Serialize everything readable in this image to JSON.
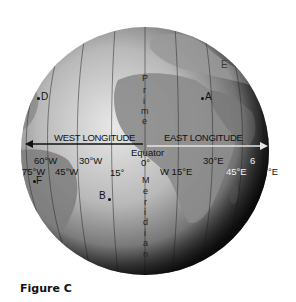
{
  "figure": {
    "caption": "Figure C",
    "globe": {
      "center": [
        145,
        151
      ],
      "radius": 124
    },
    "prime_meridian_label": [
      "P",
      "r",
      "i",
      "m",
      "e"
    ],
    "meridian_label": [
      "M",
      "e",
      "r",
      "i",
      "d",
      "i",
      "a",
      "n"
    ],
    "equator_label": "Equator",
    "arrows": {
      "west": "WEST LONGITUDE",
      "east": "EAST LONGITUDE"
    },
    "longitude_labels": {
      "w60": "60°W",
      "w30": "30°W",
      "w75": "75°W",
      "w45": "45°W",
      "w15": "15°",
      "zero": "0°",
      "e15": "W 15°E",
      "e30": "30°E",
      "e45": "45°E",
      "e60": "6",
      "e75": "°E"
    },
    "points": {
      "A": "A",
      "B": "B",
      "D": "D",
      "E": "E",
      "F": "F"
    },
    "colors": {
      "ocean_light": "#d8d8d8",
      "land": "#8a8a8a",
      "shadow": "#1a1a1a",
      "grid": "#333333"
    }
  }
}
